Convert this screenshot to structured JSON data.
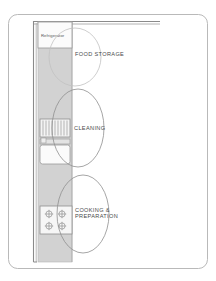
{
  "diagram": {
    "type": "kitchen-floor-plan",
    "title_visible": false,
    "colors": {
      "frame_border": "#b9b9b9",
      "wall_line": "#8a8a8a",
      "counter_fill": "#d2d2d2",
      "counter_stroke": "#a8a8a8",
      "fixture_fill": "#f2f2f2",
      "fixture_stroke": "#9a9a9a",
      "zone_ellipse": "#9e9e9e",
      "label_text": "#4a4a4a",
      "fixture_text": "#555555",
      "background": "#ffffff"
    },
    "frame": {
      "x": 8,
      "y": 14,
      "width": 200,
      "height": 255,
      "corner_radius": 9
    },
    "walls": [
      {
        "name": "top-wall",
        "orientation": "horizontal",
        "x1": 34,
        "y1": 22,
        "x2": 160,
        "y2": 22
      },
      {
        "name": "left-wall",
        "orientation": "vertical",
        "x1": 34,
        "y1": 22,
        "x2": 34,
        "y2": 262
      }
    ],
    "counter": {
      "label": "counter-run",
      "x": 38,
      "y": 22,
      "width": 34,
      "height": 240
    }
  },
  "fixtures": [
    {
      "id": "refrigerator",
      "label": "Refrigerator",
      "shape": "rectangle",
      "x": 38,
      "y": 22,
      "width": 34,
      "height": 26,
      "label_x": 41,
      "label_y": 36
    },
    {
      "id": "dishwasher",
      "label": "",
      "shape": "rectangle-ribbed",
      "x": 40,
      "y": 119,
      "width": 30,
      "height": 18,
      "rib_count": 9
    },
    {
      "id": "sink",
      "label": "",
      "shape": "rounded-rectangle",
      "x": 40,
      "y": 141,
      "width": 30,
      "height": 22
    },
    {
      "id": "range-cooktop",
      "label": "",
      "shape": "rectangle-four-burner",
      "x": 40,
      "y": 206,
      "width": 32,
      "height": 28,
      "burner_count": 4
    }
  ],
  "zones": [
    {
      "id": "food-storage",
      "label": "FOOD STORAGE",
      "lines": [
        "FOOD STORAGE"
      ],
      "ellipse": {
        "cx": 75,
        "cy": 57,
        "rx": 26,
        "ry": 29
      },
      "label_x": 75,
      "label_y": 55
    },
    {
      "id": "cleaning",
      "label": "CLEANING",
      "lines": [
        "CLEANING"
      ],
      "ellipse": {
        "cx": 78,
        "cy": 128,
        "rx": 26,
        "ry": 39
      },
      "label_x": 74,
      "label_y": 129
    },
    {
      "id": "cooking-preparation",
      "label": "COOKING & PREPARATION",
      "lines": [
        "COOKING &",
        "PREPARATION"
      ],
      "ellipse": {
        "cx": 83,
        "cy": 214,
        "rx": 26,
        "ry": 39
      },
      "label_x": 75,
      "label_y": 212
    }
  ]
}
